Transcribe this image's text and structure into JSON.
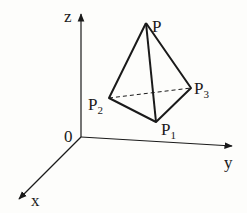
{
  "diagram": {
    "axes": {
      "z_label": "z",
      "y_label": "y",
      "x_label": "x",
      "origin_label": "0"
    },
    "points": {
      "P": {
        "label": "P",
        "sub": ""
      },
      "P1": {
        "label": "P",
        "sub": "1"
      },
      "P2": {
        "label": "P",
        "sub": "2"
      },
      "P3": {
        "label": "P",
        "sub": "3"
      }
    },
    "colors": {
      "stroke": "#1a1a1a",
      "background": "#fdfdfb"
    }
  }
}
